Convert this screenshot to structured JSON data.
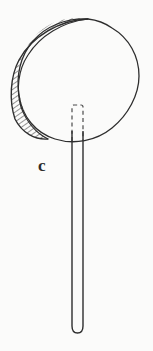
{
  "figure": {
    "caption_label": "c",
    "background_color": "#fbfbfa",
    "ink_color": "#2b2b2b",
    "parts": {
      "disc": {
        "name": "circular-head",
        "center_x": 79,
        "center_y": 79,
        "radius_x": 62,
        "radius_y": 61
      },
      "crescent": {
        "name": "hatched-crescent-rim",
        "hatch_color": "#3a3a3a",
        "hatch_spacing": 3,
        "hatch_angle_deg": 55,
        "description": "offset outer arc on upper-left forming hatched lune"
      },
      "hidden_tang": {
        "name": "dashed-hidden-tang",
        "x": 72,
        "y": 105,
        "width": 11,
        "height": 36,
        "stroke_style": "dashed"
      },
      "handle": {
        "name": "handle-shaft",
        "left_x": 72,
        "right_x": 83,
        "top_y": 131,
        "bottom_y": 333,
        "tip": "rounded"
      }
    }
  }
}
